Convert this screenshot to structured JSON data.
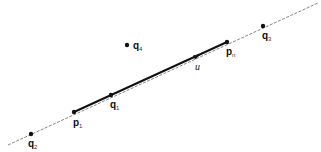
{
  "diagram": {
    "width": 321,
    "height": 152,
    "line": {
      "x1": 8,
      "y1": 145,
      "x2": 318,
      "y2": 3,
      "color": "#555555"
    },
    "segment": {
      "x1": 74,
      "y1": 112,
      "x2": 227,
      "y2": 42,
      "color": "#111111"
    },
    "direction": {
      "label": "u",
      "x": 197,
      "y": 56
    },
    "points": [
      {
        "id": "q4",
        "base": "q",
        "sub": "4",
        "x": 127,
        "y": 45
      },
      {
        "id": "pn",
        "base": "p",
        "sub": "n",
        "x": 227,
        "y": 42
      },
      {
        "id": "q3",
        "base": "q",
        "sub": "3",
        "x": 263,
        "y": 26
      },
      {
        "id": "p1",
        "base": "p",
        "sub": "1",
        "x": 74,
        "y": 112
      },
      {
        "id": "q1",
        "base": "q",
        "sub": "1",
        "x": 111,
        "y": 95
      },
      {
        "id": "q2",
        "base": "q",
        "sub": "2",
        "x": 31,
        "y": 134
      }
    ]
  }
}
